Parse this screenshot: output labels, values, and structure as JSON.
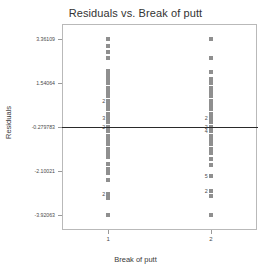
{
  "chart_data": {
    "type": "scatter",
    "title": "Residuals vs. Break of putt",
    "xlabel": "Break of putt",
    "ylabel": "Residuals",
    "grid": false,
    "legend": null,
    "xlim": [
      0.55,
      2.45
    ],
    "ylim": [
      -4.55,
      4.0
    ],
    "xticks": [
      {
        "value": 1,
        "label": "1"
      },
      {
        "value": 2,
        "label": "2"
      }
    ],
    "yticks": [
      {
        "value": 3.36109,
        "label": "3.36109"
      },
      {
        "value": 1.54064,
        "label": "1.54064"
      },
      {
        "value": -0.279783,
        "label": "-0.279783"
      },
      {
        "value": -2.10021,
        "label": "-2.10021"
      },
      {
        "value": -3.92063,
        "label": "-3.92063"
      }
    ],
    "reference_line": {
      "y": -0.279783,
      "color": "#2a2a2a",
      "orientation": "horizontal"
    },
    "point_color": "#8f8f8f",
    "series": [
      {
        "name": "Break of putt = 1",
        "x": 1,
        "points": [
          {
            "y": 3.36,
            "count": 1
          },
          {
            "y": 3.1,
            "count": 1
          },
          {
            "y": 2.84,
            "count": 1
          },
          {
            "y": 2.6,
            "count": 1
          },
          {
            "y": 2.05,
            "count": 1
          },
          {
            "y": 1.88,
            "count": 1
          },
          {
            "y": 1.7,
            "count": 1
          },
          {
            "y": 1.54,
            "count": 1
          },
          {
            "y": 1.36,
            "count": 1
          },
          {
            "y": 1.18,
            "count": 1
          },
          {
            "y": 1.0,
            "count": 1
          },
          {
            "y": 0.82,
            "count": 2
          },
          {
            "y": 0.64,
            "count": 1
          },
          {
            "y": 0.46,
            "count": 1
          },
          {
            "y": 0.28,
            "count": 1
          },
          {
            "y": 0.1,
            "count": 3
          },
          {
            "y": -0.08,
            "count": 1
          },
          {
            "y": -0.28,
            "count": 2
          },
          {
            "y": -0.46,
            "count": 1
          },
          {
            "y": -0.64,
            "count": 1
          },
          {
            "y": -0.82,
            "count": 1
          },
          {
            "y": -1.0,
            "count": 1
          },
          {
            "y": -1.18,
            "count": 1
          },
          {
            "y": -1.36,
            "count": 1
          },
          {
            "y": -1.54,
            "count": 1
          },
          {
            "y": -1.8,
            "count": 1
          },
          {
            "y": -2.0,
            "count": 1
          },
          {
            "y": -2.2,
            "count": 1
          },
          {
            "y": -2.46,
            "count": 1
          },
          {
            "y": -3.05,
            "count": 2
          },
          {
            "y": -3.22,
            "count": 1
          },
          {
            "y": -3.92,
            "count": 1
          }
        ]
      },
      {
        "name": "Break of putt = 2",
        "x": 2,
        "points": [
          {
            "y": 3.36,
            "count": 1
          },
          {
            "y": 2.58,
            "count": 1
          },
          {
            "y": 2.0,
            "count": 1
          },
          {
            "y": 1.72,
            "count": 1
          },
          {
            "y": 1.54,
            "count": 1
          },
          {
            "y": 1.36,
            "count": 1
          },
          {
            "y": 1.18,
            "count": 1
          },
          {
            "y": 1.0,
            "count": 1
          },
          {
            "y": 0.82,
            "count": 1
          },
          {
            "y": 0.64,
            "count": 1
          },
          {
            "y": 0.46,
            "count": 1
          },
          {
            "y": 0.28,
            "count": 1
          },
          {
            "y": 0.1,
            "count": 2
          },
          {
            "y": -0.08,
            "count": 1
          },
          {
            "y": -0.28,
            "count": 2
          },
          {
            "y": -0.46,
            "count": 4
          },
          {
            "y": -0.64,
            "count": 1
          },
          {
            "y": -0.82,
            "count": 1
          },
          {
            "y": -1.0,
            "count": 1
          },
          {
            "y": -1.18,
            "count": 1
          },
          {
            "y": -1.36,
            "count": 1
          },
          {
            "y": -1.6,
            "count": 1
          },
          {
            "y": -1.85,
            "count": 1
          },
          {
            "y": -2.3,
            "count": 5
          },
          {
            "y": -2.95,
            "count": 2
          },
          {
            "y": -3.15,
            "count": 1
          },
          {
            "y": -3.92,
            "count": 1
          }
        ]
      }
    ]
  }
}
